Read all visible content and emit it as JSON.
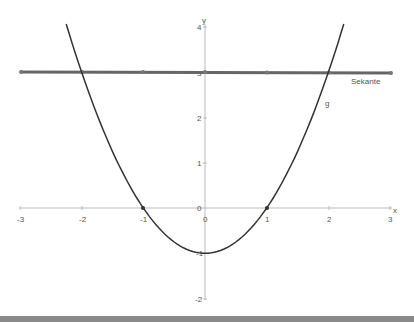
{
  "chart_data": {
    "type": "line",
    "title": "",
    "xlabel": "x",
    "ylabel": "y",
    "xlim": [
      -3,
      3
    ],
    "ylim": [
      -2,
      4
    ],
    "grid": false,
    "x_ticks": [
      "-3",
      "-2",
      "-1",
      "0",
      "1",
      "2",
      "3"
    ],
    "y_ticks": [
      "-2",
      "-1",
      "0",
      "1",
      "2",
      "3",
      "4"
    ],
    "series": [
      {
        "name": "g",
        "label": "g",
        "function": "x^2 - 1",
        "x": [
          -2.25,
          -2,
          -1.5,
          -1,
          -0.5,
          0,
          0.5,
          1,
          1.5,
          2,
          2.25
        ],
        "values": [
          4.06,
          3,
          1.25,
          0,
          -0.75,
          -1,
          -0.75,
          0,
          1.25,
          3,
          4.06
        ],
        "color": "#333333"
      },
      {
        "name": "Sekante",
        "label": "Sekante",
        "function": "y = 3",
        "x": [
          -3,
          -2,
          -1,
          0,
          1,
          2,
          3
        ],
        "values": [
          3,
          3,
          3,
          3,
          3,
          3,
          3
        ],
        "color": "#666666"
      }
    ],
    "points": [
      {
        "x": -1,
        "y": 0
      },
      {
        "x": 1,
        "y": 0
      },
      {
        "x": -2,
        "y": 3
      },
      {
        "x": 2,
        "y": 3
      }
    ],
    "annotations": [
      "Sekante",
      "g"
    ]
  },
  "axes": {
    "x_label": "x",
    "y_label": "y"
  },
  "labels": {
    "secant": "Sekante",
    "curve": "g"
  },
  "colors": {
    "curve": "#333333",
    "secant": "#666666",
    "axis": "#bbbbbb",
    "bottom_bar": "#8a8a8a"
  }
}
